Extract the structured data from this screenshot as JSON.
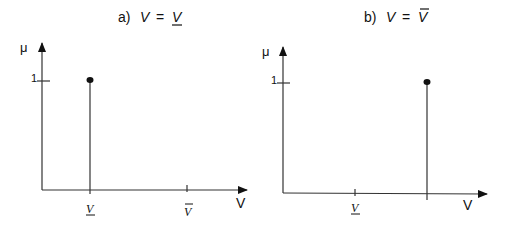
{
  "panels": [
    {
      "id": "a",
      "title_prefix": "a)",
      "title_lhs": "V",
      "title_eq": "=",
      "title_rhs": "V",
      "title_rhs_decoration": "underline",
      "y_axis_label": "μ",
      "x_axis_label": "V",
      "y_tick_label": "1",
      "x_ticks": [
        {
          "label": "V",
          "decoration": "underline",
          "position": "lower"
        },
        {
          "label": "V",
          "decoration": "overline",
          "position": "upper"
        }
      ],
      "stem_at": "lower",
      "stem_height": 1
    },
    {
      "id": "b",
      "title_prefix": "b)",
      "title_lhs": "V",
      "title_eq": "=",
      "title_rhs": "V",
      "title_rhs_decoration": "overline",
      "y_axis_label": "μ",
      "x_axis_label": "V",
      "y_tick_label": "1",
      "x_ticks": [
        {
          "label": "V",
          "decoration": "underline",
          "position": "lower"
        },
        {
          "label": "",
          "decoration": "none",
          "position": "upper"
        }
      ],
      "stem_at": "upper",
      "stem_height": 1
    }
  ],
  "colors": {
    "ink": "#333333",
    "background": "#ffffff"
  }
}
